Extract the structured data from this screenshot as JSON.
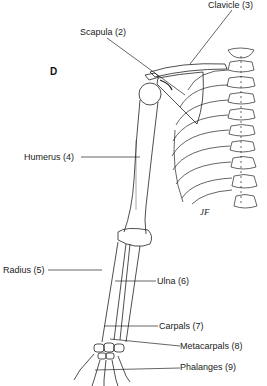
{
  "panel_letter": "D",
  "signature": "JF",
  "labels": [
    {
      "id": "scapula",
      "text": "Scapula (2)"
    },
    {
      "id": "clavicle",
      "text": "Clavicle (3)"
    },
    {
      "id": "humerus",
      "text": "Humerus (4)"
    },
    {
      "id": "radius",
      "text": "Radius (5)"
    },
    {
      "id": "ulna",
      "text": "Ulna (6)"
    },
    {
      "id": "carpals",
      "text": "Carpals (7)"
    },
    {
      "id": "metacarpals",
      "text": "Metacarpals (8)"
    },
    {
      "id": "phalanges",
      "text": "Phalanges (9)"
    }
  ],
  "colors": {
    "line": "#222222",
    "background": "#ffffff"
  }
}
